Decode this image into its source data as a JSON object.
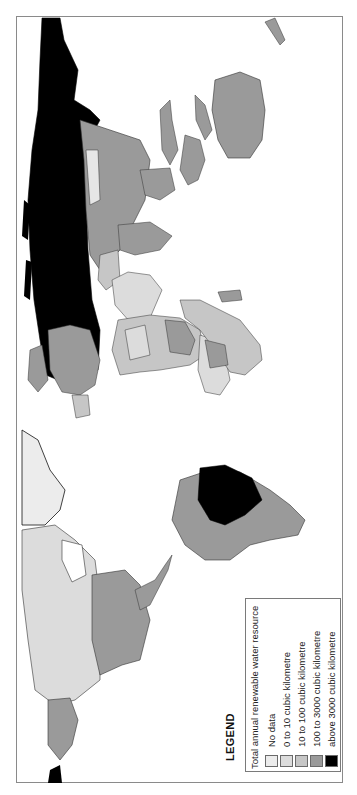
{
  "map": {
    "orientation": "rotated 90 degrees (north to the left)",
    "subject": "Total annual renewable water resource by country",
    "colors": {
      "ocean": "#ffffff",
      "no_data": "#ececec",
      "c0_10": "#dcdcdc",
      "c10_100": "#c6c6c6",
      "c100_3000": "#9a9a9a",
      "above3000": "#000000",
      "border": "#333333"
    }
  },
  "legend": {
    "title": "LEGEND",
    "subtitle": "Total annual renewable water resource",
    "items": [
      {
        "label": "No data",
        "color": "#ececec"
      },
      {
        "label": "0 to 10 cubic kilometre",
        "color": "#dcdcdc"
      },
      {
        "label": "10 to 100 cubic kilometre",
        "color": "#c6c6c6"
      },
      {
        "label": "100 to 3000 cubic kilometre",
        "color": "#9a9a9a"
      },
      {
        "label": "above 3000 cubic kilometre",
        "color": "#000000"
      }
    ]
  }
}
